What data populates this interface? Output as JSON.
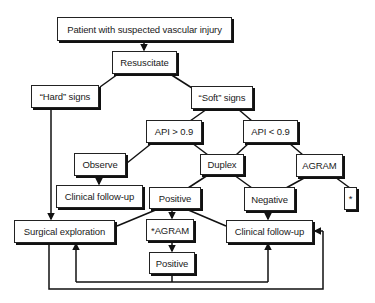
{
  "diagram": {
    "title_node": "Patient with suspected vascular injury",
    "nodes": {
      "patient": "Patient with suspected vascular injury",
      "resuscitate": "Resuscitate",
      "hard_signs": "“Hard” signs",
      "soft_signs": "“Soft” signs",
      "api_gt": "API > 0.9",
      "api_lt": "API < 0.9",
      "observe": "Observe",
      "duplex": "Duplex",
      "agram": "AGRAM",
      "clinical_followup_left": "Clinical follow-up",
      "positive": "Positive",
      "negative": "Negative",
      "star": "*",
      "surgical_exploration": "Surgical exploration",
      "star_agram": "*AGRAM",
      "clinical_followup_right": "Clinical follow-up",
      "positive_bottom": "Positive"
    },
    "edges": [
      [
        "patient",
        "resuscitate"
      ],
      [
        "resuscitate",
        "hard_signs"
      ],
      [
        "resuscitate",
        "soft_signs"
      ],
      [
        "soft_signs",
        "api_gt"
      ],
      [
        "soft_signs",
        "api_lt"
      ],
      [
        "api_gt",
        "observe"
      ],
      [
        "api_gt",
        "duplex"
      ],
      [
        "api_lt",
        "duplex"
      ],
      [
        "api_lt",
        "agram"
      ],
      [
        "observe",
        "clinical_followup_left"
      ],
      [
        "duplex",
        "positive"
      ],
      [
        "duplex",
        "negative"
      ],
      [
        "agram",
        "negative"
      ],
      [
        "agram",
        "star"
      ],
      [
        "hard_signs",
        "surgical_exploration"
      ],
      [
        "positive",
        "surgical_exploration"
      ],
      [
        "positive",
        "star_agram"
      ],
      [
        "positive",
        "clinical_followup_right"
      ],
      [
        "negative",
        "clinical_followup_right"
      ],
      [
        "star_agram",
        "positive_bottom"
      ],
      [
        "positive_bottom",
        "surgical_exploration"
      ],
      [
        "positive_bottom",
        "clinical_followup_right"
      ],
      [
        "surgical_exploration",
        "clinical_followup_right"
      ]
    ],
    "colors": {
      "line": "#111111",
      "box_border": "#222222",
      "background": "#ffffff"
    }
  }
}
